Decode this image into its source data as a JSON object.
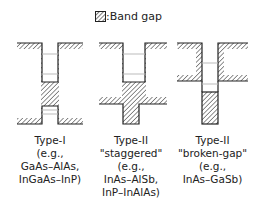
{
  "legend": {
    "icon": "hatched-square-icon",
    "label": ":Band gap"
  },
  "diagrams": [
    {
      "type": "Type-I",
      "subtitle": "",
      "example_prefix": "(e.g.,",
      "examples": [
        "GaAs–AlAs,",
        "InGaAs–InP)"
      ]
    },
    {
      "type": "Type-II",
      "subtitle": "\"staggered\"",
      "example_prefix": "(e.g.,",
      "examples": [
        "InAs–AlSb,",
        "InP–InAlAs)"
      ]
    },
    {
      "type": "Type-II",
      "subtitle": "\"broken-gap\"",
      "example_prefix": "(e.g.,",
      "examples": [
        "InAs–GaSb)"
      ]
    }
  ],
  "colors": {
    "outline": "#222222",
    "hatch": "#555555",
    "level_line": "#bbbbbb"
  }
}
